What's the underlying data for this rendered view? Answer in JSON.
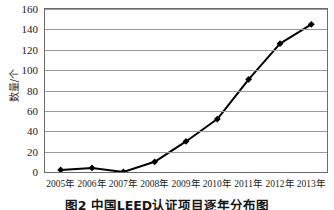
{
  "figure": {
    "caption": "图2  中国LEED认证项目逐年分布图",
    "ylabel": "数量/个"
  },
  "chart_data": {
    "type": "line",
    "title": "",
    "subtitle": "",
    "xlabel": "",
    "ylabel": "数量/个",
    "categories": [
      "2005年",
      "2006年",
      "2007年",
      "2008年",
      "2009年",
      "2010年",
      "2011年",
      "2012年",
      "2013年"
    ],
    "values": [
      2,
      4,
      0,
      10,
      30,
      52,
      91,
      126,
      145
    ],
    "series": [
      {
        "name": "中国LEED认证项目数量",
        "values": [
          2,
          4,
          0,
          10,
          30,
          52,
          91,
          126,
          145
        ],
        "color": "#000000",
        "marker": "diamond",
        "line_width": 2
      }
    ],
    "ylim": [
      0,
      160
    ],
    "yticks": [
      0,
      20,
      40,
      60,
      80,
      100,
      120,
      140,
      160
    ],
    "ytick_labels": [
      "0",
      "20",
      "40",
      "60",
      "80",
      "100",
      "120",
      "140",
      "160"
    ],
    "xtick_labels": [
      "2005年",
      "2006年",
      "2007年",
      "2008年",
      "2009年",
      "2010年",
      "2011年",
      "2012年",
      "2013年"
    ],
    "grid": "horizontal",
    "grid_color": "#9a9a9a",
    "legend": "none",
    "frame": true,
    "background": "#ffffff"
  }
}
